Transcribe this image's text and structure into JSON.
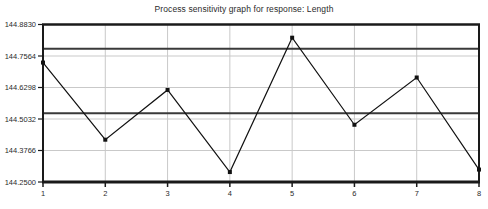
{
  "chart_data": {
    "type": "line",
    "title": "Process sensitivity graph for response: Length",
    "xlabel": "",
    "ylabel": "",
    "x": [
      1,
      2,
      3,
      4,
      5,
      6,
      7,
      8
    ],
    "values": [
      144.73,
      144.42,
      144.62,
      144.29,
      144.83,
      144.48,
      144.67,
      144.3
    ],
    "ylim": [
      144.25,
      144.883
    ],
    "ytick_labels": [
      "144.8830",
      "144.7564",
      "144.6298",
      "144.5032",
      "144.3766",
      "144.2500"
    ],
    "ytick_values": [
      144.883,
      144.7564,
      144.6298,
      144.5032,
      144.3766,
      144.25
    ],
    "xtick_labels": [
      "1",
      "2",
      "3",
      "4",
      "5",
      "6",
      "7",
      "8"
    ],
    "reference_lines": [
      144.786,
      144.526
    ],
    "grid": true,
    "legend": "none",
    "marker": "square",
    "colors": {
      "series_line": "#111111",
      "marker": "#111111",
      "frame": "#1a1a1a",
      "gridline": "#c9c9c9",
      "reference_line": "#3a3a3a",
      "text": "#2b2b2b",
      "background": "#ffffff"
    }
  }
}
